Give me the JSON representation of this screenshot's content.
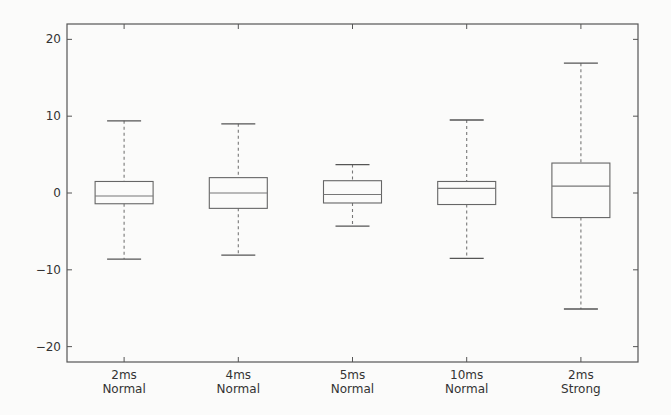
{
  "chart_data": {
    "type": "boxplot",
    "title": "",
    "xlabel": "",
    "ylabel": "",
    "ylim": [
      -22,
      22
    ],
    "yticks": [
      20,
      10,
      0,
      -10,
      -20
    ],
    "ytick_labels": [
      "20",
      "10",
      "0",
      "−10",
      "−20"
    ],
    "grid": false,
    "legend": null,
    "categories": [
      [
        "2ms",
        "Normal"
      ],
      [
        "4ms",
        "Normal"
      ],
      [
        "5ms",
        "Normal"
      ],
      [
        "10ms",
        "Normal"
      ],
      [
        "2ms",
        "Strong"
      ]
    ],
    "series": [
      {
        "name": "2ms Normal",
        "whisker_low": -8.6,
        "q1": -1.4,
        "median": -0.4,
        "q3": 1.5,
        "whisker_high": 9.4
      },
      {
        "name": "4ms Normal",
        "whisker_low": -8.1,
        "q1": -2.0,
        "median": 0.0,
        "q3": 2.0,
        "whisker_high": 9.0
      },
      {
        "name": "5ms Normal",
        "whisker_low": -4.3,
        "q1": -1.3,
        "median": -0.2,
        "q3": 1.6,
        "whisker_high": 3.7
      },
      {
        "name": "10ms Normal",
        "whisker_low": -8.5,
        "q1": -1.5,
        "median": 0.6,
        "q3": 1.5,
        "whisker_high": 9.5
      },
      {
        "name": "2ms Strong",
        "whisker_low": -15.1,
        "q1": -3.2,
        "median": 0.9,
        "q3": 3.9,
        "whisker_high": 16.9
      }
    ]
  },
  "colors": {
    "background": "#fbfbfa",
    "frame": "#555555",
    "box": "#666666",
    "text": "#333333"
  }
}
